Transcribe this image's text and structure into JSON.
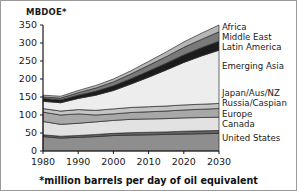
{
  "figure": {
    "yaxis_title": "MBDOE*",
    "footnote": "*million barrels per day of oil equivalent",
    "border_color": "#9a9a9a",
    "background": "#ffffff"
  },
  "chart_data": {
    "type": "area",
    "title": "",
    "subtitle": "",
    "xlabel": "",
    "ylabel": "MBDOE*",
    "note": "*million barrels per day of oil equivalent",
    "stacked": true,
    "grid": false,
    "legend_position": "right-inline",
    "xlim": [
      1980,
      2030
    ],
    "ylim": [
      0,
      350
    ],
    "xticks": [
      1980,
      1990,
      2000,
      2010,
      2020,
      2030
    ],
    "xticklabels": [
      "1980",
      "1990",
      "2000",
      "2010",
      "2020",
      "2030"
    ],
    "yticks": [
      0,
      50,
      100,
      150,
      200,
      250,
      300,
      350
    ],
    "yticklabels": [
      "0",
      "50",
      "100",
      "150",
      "200",
      "250",
      "300",
      "350"
    ],
    "x": [
      1980,
      1985,
      1990,
      1995,
      2000,
      2005,
      2010,
      2015,
      2020,
      2025,
      2030
    ],
    "series": [
      {
        "name": "United States",
        "color": "#8e8e8e",
        "values": [
          40,
          36,
          38,
          40,
          43,
          44,
          45,
          46,
          47,
          48,
          49
        ]
      },
      {
        "name": "Canada",
        "color": "#636363",
        "values": [
          5,
          5,
          5,
          6,
          6,
          7,
          7,
          7,
          8,
          8,
          8
        ]
      },
      {
        "name": "Europe",
        "color": "#e2e2e2",
        "values": [
          37,
          33,
          34,
          35,
          36,
          37,
          37,
          37,
          37,
          37,
          37
        ]
      },
      {
        "name": "Russia/Caspian",
        "color": "#a8a8a8",
        "values": [
          26,
          26,
          26,
          19,
          18,
          19,
          20,
          21,
          22,
          23,
          24
        ]
      },
      {
        "name": "Japan/Aus/NZ",
        "color": "#c4c4c4",
        "values": [
          10,
          11,
          12,
          13,
          14,
          14,
          14,
          14,
          14,
          14,
          14
        ]
      },
      {
        "name": "Emerging Asia",
        "color": "#ededed",
        "values": [
          20,
          23,
          31,
          42,
          51,
          65,
          82,
          100,
          118,
          134,
          148
        ]
      },
      {
        "name": "Latin America",
        "color": "#1c1c1c",
        "values": [
          8,
          8,
          9,
          11,
          13,
          15,
          17,
          19,
          21,
          23,
          25
        ]
      },
      {
        "name": "Middle East",
        "color": "#7a7a7a",
        "values": [
          4,
          5,
          7,
          9,
          11,
          13,
          16,
          18,
          21,
          23,
          26
        ]
      },
      {
        "name": "Africa",
        "color": "#b6b6b6",
        "values": [
          5,
          5,
          6,
          7,
          8,
          9,
          11,
          13,
          15,
          17,
          19
        ]
      }
    ],
    "series_labels": [
      {
        "name": "Africa",
        "y_px": 29
      },
      {
        "name": "Middle East",
        "y_px": 39
      },
      {
        "name": "Latin America",
        "y_px": 49
      },
      {
        "name": "Emerging Asia",
        "y_px": 68
      },
      {
        "name": "Japan/Aus/NZ",
        "y_px": 95
      },
      {
        "name": "Russia/Caspian",
        "y_px": 105
      },
      {
        "name": "Europe",
        "y_px": 116
      },
      {
        "name": "Canada",
        "y_px": 126
      },
      {
        "name": "United States",
        "y_px": 140
      }
    ]
  }
}
